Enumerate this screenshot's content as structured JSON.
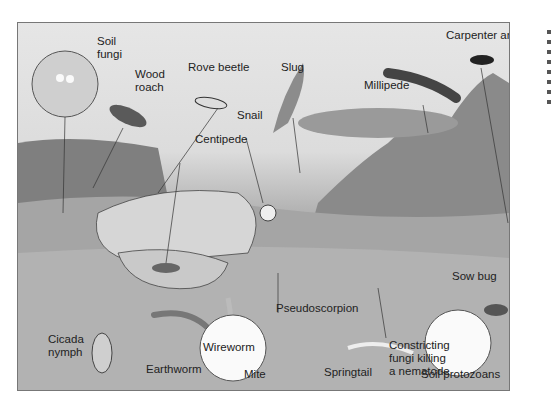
{
  "figure": {
    "labels": {
      "soil_fungi": "Soil\nfungi",
      "wood_roach": "Wood\nroach",
      "rove_beetle": "Rove beetle",
      "slug": "Slug",
      "millipede": "Millipede",
      "carpenter_ant": "Carpenter ant",
      "snail": "Snail",
      "centipede": "Centipede",
      "sow_bug": "Sow bug",
      "pseudoscorpion": "Pseudoscorpion",
      "cicada_nymph": "Cicada\nnymph",
      "wireworm": "Wireworm",
      "earthworm": "Earthworm",
      "mite": "Mite",
      "springtail": "Springtail",
      "constricting_fungi": "Constricting\nfungi killing\na nematode",
      "soil_protozoans": "Soil protozoans"
    },
    "colors": {
      "sky": "#e4e4e4",
      "soil": "#9e9e9e",
      "rock": "#cfcfcf",
      "outline": "#333333"
    }
  }
}
